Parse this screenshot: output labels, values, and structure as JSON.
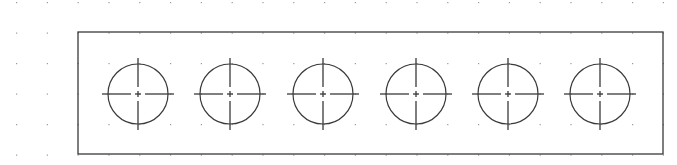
{
  "drawing": {
    "width": 677,
    "height": 165,
    "background": "#ffffff",
    "line_color": "#3a3a3a",
    "grid": {
      "dot_color": "#9a9a9a",
      "origin_x": 16,
      "origin_y": 2,
      "spacing_x": 30.8,
      "spacing_y": 30.5,
      "cols": 22,
      "rows": 6
    },
    "plate": {
      "x": 78,
      "y": 32,
      "width": 585,
      "height": 122
    },
    "holes": {
      "radius": 30,
      "center_y": 94,
      "centerline_extent": 36,
      "centers_x": [
        138,
        230,
        323,
        416,
        508,
        600
      ]
    }
  }
}
